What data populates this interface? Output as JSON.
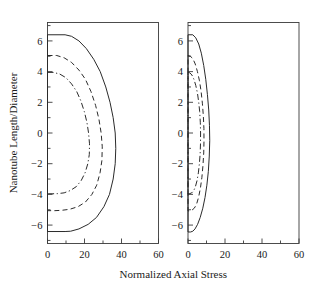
{
  "figure": {
    "background_color": "#ffffff",
    "line_color": "#2b2b2b",
    "axis_color": "#3a3a3a"
  },
  "axis_titles": {
    "x": "Normalized Axial Stress",
    "y": "Nanotube Length/Diameter"
  },
  "chart_data": {
    "type": "line",
    "title": "",
    "xlabel": "Normalized Axial Stress",
    "ylabel": "Nanotube Length/Diameter",
    "xlim": [
      0,
      60
    ],
    "ylim": [
      -7.2,
      7.2
    ],
    "xticks": [
      0,
      20,
      40,
      60
    ],
    "xticklabels": [
      "0",
      "20",
      "40",
      "60"
    ],
    "xminorticks": [
      10,
      30,
      50
    ],
    "yticks": [
      -6,
      -4,
      -2,
      0,
      2,
      4,
      6
    ],
    "yticklabels": [
      "−6",
      "−4",
      "−2",
      "0",
      "2",
      "4",
      "6"
    ],
    "yminorticks": [
      -7,
      -5,
      -3,
      -1,
      1,
      3,
      5,
      7
    ],
    "grid": false,
    "legend": "none",
    "panels": [
      {
        "name": "left-panel",
        "position": "left",
        "series": [
          {
            "name": "outer-solid-curve",
            "linestyle": "solid",
            "max_stress": 37,
            "y_extent": [
              -6.4,
              6.4
            ],
            "points": [
              [
                0.0,
                6.4
              ],
              [
                9.5,
                6.4
              ],
              [
                13.0,
                6.3
              ],
              [
                17.0,
                6.0
              ],
              [
                21.0,
                5.5
              ],
              [
                25.0,
                4.8
              ],
              [
                28.5,
                4.0
              ],
              [
                31.5,
                3.0
              ],
              [
                33.8,
                2.0
              ],
              [
                35.5,
                1.0
              ],
              [
                36.6,
                0.0
              ],
              [
                36.9,
                -1.0
              ],
              [
                36.6,
                -2.0
              ],
              [
                35.5,
                -3.0
              ],
              [
                33.5,
                -4.0
              ],
              [
                30.5,
                -4.8
              ],
              [
                26.5,
                -5.5
              ],
              [
                22.0,
                -5.95
              ],
              [
                17.0,
                -6.25
              ],
              [
                12.5,
                -6.4
              ],
              [
                9.5,
                -6.42
              ],
              [
                0.0,
                -6.42
              ]
            ]
          },
          {
            "name": "middle-dashed-curve",
            "linestyle": "dashed",
            "max_stress": 30,
            "y_extent": [
              -5.0,
              5.0
            ],
            "points": [
              [
                0.0,
                5.05
              ],
              [
                5.0,
                5.05
              ],
              [
                9.0,
                4.9
              ],
              [
                13.0,
                4.6
              ],
              [
                17.0,
                4.1
              ],
              [
                20.5,
                3.5
              ],
              [
                23.5,
                2.7
              ],
              [
                26.0,
                1.8
              ],
              [
                27.8,
                0.9
              ],
              [
                29.0,
                0.0
              ],
              [
                29.6,
                -0.9
              ],
              [
                29.4,
                -1.8
              ],
              [
                28.4,
                -2.6
              ],
              [
                26.6,
                -3.4
              ],
              [
                24.0,
                -4.0
              ],
              [
                20.5,
                -4.5
              ],
              [
                16.5,
                -4.8
              ],
              [
                12.0,
                -4.97
              ],
              [
                7.5,
                -5.04
              ],
              [
                4.0,
                -5.06
              ],
              [
                0.0,
                -5.06
              ]
            ]
          },
          {
            "name": "inner-dashdot-curve",
            "linestyle": "dashdot",
            "max_stress": 23,
            "y_extent": [
              -3.95,
              3.95
            ],
            "points": [
              [
                0.0,
                3.95
              ],
              [
                3.0,
                3.95
              ],
              [
                6.5,
                3.85
              ],
              [
                10.0,
                3.6
              ],
              [
                13.0,
                3.2
              ],
              [
                15.8,
                2.7
              ],
              [
                18.0,
                2.1
              ],
              [
                19.9,
                1.4
              ],
              [
                21.3,
                0.7
              ],
              [
                22.2,
                0.0
              ],
              [
                22.7,
                -0.7
              ],
              [
                22.6,
                -1.4
              ],
              [
                21.8,
                -2.0
              ],
              [
                20.3,
                -2.6
              ],
              [
                18.2,
                -3.1
              ],
              [
                15.5,
                -3.5
              ],
              [
                12.3,
                -3.75
              ],
              [
                9.0,
                -3.9
              ],
              [
                5.5,
                -3.95
              ],
              [
                2.5,
                -3.96
              ],
              [
                0.0,
                -3.96
              ]
            ]
          }
        ]
      },
      {
        "name": "right-panel",
        "position": "right",
        "series": [
          {
            "name": "outer-solid-curve",
            "linestyle": "solid",
            "max_stress": 12,
            "y_extent": [
              -6.4,
              6.4
            ],
            "points": [
              [
                0.0,
                6.4
              ],
              [
                2.6,
                6.4
              ],
              [
                4.2,
                6.2
              ],
              [
                5.8,
                5.8
              ],
              [
                7.2,
                5.2
              ],
              [
                8.5,
                4.4
              ],
              [
                9.6,
                3.5
              ],
              [
                10.5,
                2.5
              ],
              [
                11.2,
                1.5
              ],
              [
                11.6,
                0.5
              ],
              [
                11.75,
                -0.5
              ],
              [
                11.5,
                -1.5
              ],
              [
                11.0,
                -2.5
              ],
              [
                10.2,
                -3.4
              ],
              [
                9.2,
                -4.2
              ],
              [
                8.0,
                -4.9
              ],
              [
                6.6,
                -5.5
              ],
              [
                5.2,
                -5.95
              ],
              [
                3.8,
                -6.25
              ],
              [
                2.6,
                -6.4
              ],
              [
                1.4,
                -6.45
              ],
              [
                0.0,
                -6.45
              ]
            ]
          },
          {
            "name": "middle-dashed-curve",
            "linestyle": "dashed",
            "max_stress": 9,
            "y_extent": [
              -5.0,
              5.0
            ],
            "points": [
              [
                0.0,
                5.05
              ],
              [
                1.3,
                5.0
              ],
              [
                2.6,
                4.85
              ],
              [
                3.9,
                4.5
              ],
              [
                5.1,
                4.0
              ],
              [
                6.2,
                3.4
              ],
              [
                7.1,
                2.7
              ],
              [
                7.8,
                1.9
              ],
              [
                8.3,
                1.1
              ],
              [
                8.6,
                0.3
              ],
              [
                8.65,
                -0.5
              ],
              [
                8.5,
                -1.3
              ],
              [
                8.1,
                -2.1
              ],
              [
                7.5,
                -2.9
              ],
              [
                6.7,
                -3.6
              ],
              [
                5.7,
                -4.2
              ],
              [
                4.6,
                -4.65
              ],
              [
                3.4,
                -4.9
              ],
              [
                2.2,
                -5.02
              ],
              [
                1.1,
                -5.07
              ],
              [
                0.0,
                -5.08
              ]
            ]
          },
          {
            "name": "inner-dashdot-curve",
            "linestyle": "dashdot",
            "max_stress": 7,
            "y_extent": [
              -3.95,
              3.95
            ],
            "points": [
              [
                0.0,
                3.95
              ],
              [
                1.0,
                3.92
              ],
              [
                2.1,
                3.78
              ],
              [
                3.2,
                3.5
              ],
              [
                4.2,
                3.1
              ],
              [
                5.1,
                2.6
              ],
              [
                5.8,
                2.0
              ],
              [
                6.3,
                1.4
              ],
              [
                6.65,
                0.7
              ],
              [
                6.8,
                0.0
              ],
              [
                6.75,
                -0.7
              ],
              [
                6.55,
                -1.4
              ],
              [
                6.15,
                -2.0
              ],
              [
                5.6,
                -2.6
              ],
              [
                4.9,
                -3.1
              ],
              [
                4.0,
                -3.5
              ],
              [
                3.0,
                -3.78
              ],
              [
                2.0,
                -3.9
              ],
              [
                1.0,
                -3.95
              ],
              [
                0.0,
                -3.97
              ]
            ]
          }
        ]
      }
    ]
  }
}
